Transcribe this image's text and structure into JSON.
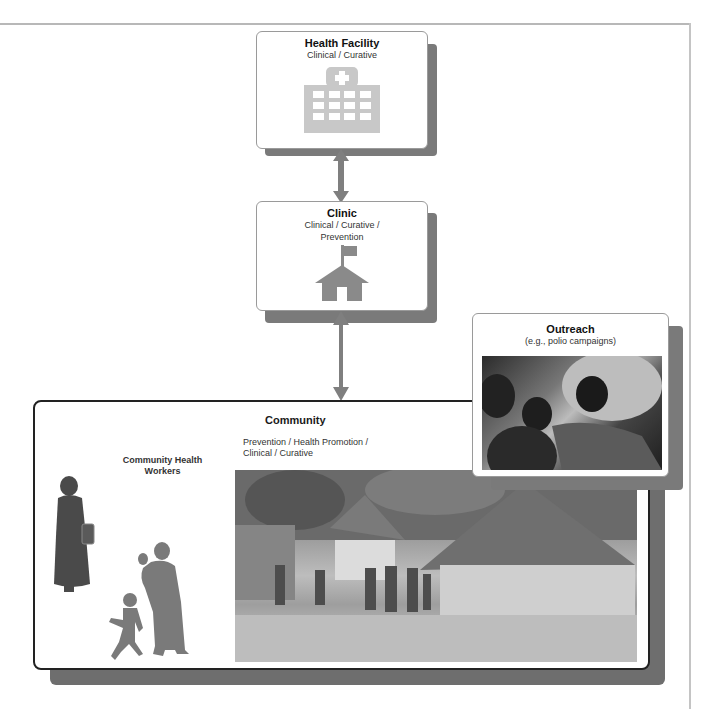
{
  "diagram": {
    "levels": [
      {
        "id": "health_facility",
        "title": "Health Facility",
        "subtitle": "Clinical / Curative",
        "icon": "hospital-icon"
      },
      {
        "id": "clinic",
        "title": "Clinic",
        "subtitle_line1": "Clinical / Curative /",
        "subtitle_line2": "Prevention",
        "icon": "house-with-flag-icon"
      },
      {
        "id": "community",
        "title": "Community",
        "subtitle_line1": "Prevention / Health Promotion /",
        "subtitle_line2": "Clinical / Curative"
      }
    ],
    "outreach": {
      "title": "Outreach",
      "subtitle": "(e.g., polio campaigns)",
      "image": "photo-vaccination-outreach"
    },
    "community_health_workers": {
      "label_line1": "Community Health",
      "label_line2": "Workers",
      "icon": "health-worker-silhouette-icon",
      "family_icon": "mother-and-children-silhouette-icon"
    },
    "community_image": "photo-village-huts",
    "connectors": [
      {
        "from": "health_facility",
        "to": "clinic",
        "type": "double-arrow"
      },
      {
        "from": "clinic",
        "to": "community",
        "type": "double-arrow"
      }
    ],
    "colors": {
      "icon_gray": "#c8c8c8",
      "shadow_gray": "#7a7a7a",
      "arrow_gray": "#7f7f7f",
      "border_dark": "#222222"
    }
  }
}
